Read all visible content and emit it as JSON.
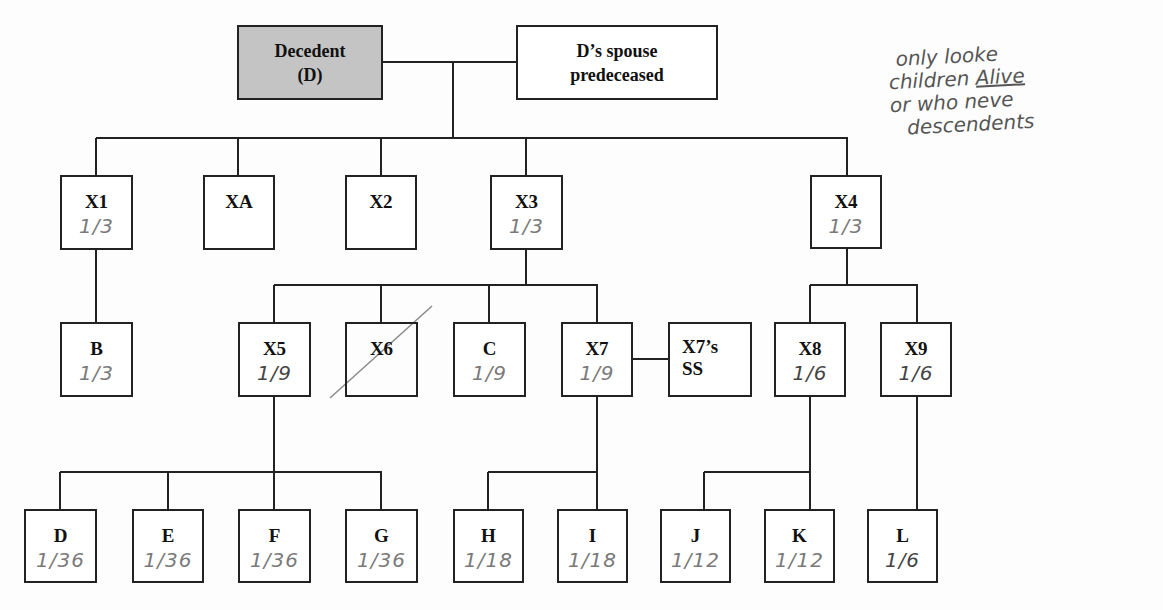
{
  "diagram": {
    "type": "family-tree / intestate succession chart",
    "root": {
      "decedent": {
        "label_line1": "Decedent",
        "label_line2": "(D)",
        "shaded": true
      },
      "spouse": {
        "label_line1": "D’s spouse",
        "label_line2": "predeceased"
      }
    },
    "children": [
      {
        "id": "X1",
        "share": "1/3"
      },
      {
        "id": "XA",
        "share": ""
      },
      {
        "id": "X2",
        "share": ""
      },
      {
        "id": "X3",
        "share": "1/3"
      },
      {
        "id": "X4",
        "share": "1/3"
      }
    ],
    "grandchildren": [
      {
        "id": "B",
        "parent": "X1",
        "share": "1/3"
      },
      {
        "id": "X5",
        "parent": "X3",
        "share": "1/9"
      },
      {
        "id": "X6",
        "parent": "X3",
        "share": "",
        "crossed_out": true
      },
      {
        "id": "C",
        "parent": "X3",
        "share": "1/9"
      },
      {
        "id": "X7",
        "parent": "X3",
        "share": "1/9"
      },
      {
        "id": "X7’s SS",
        "label_line1": "X7’s",
        "label_line2": "SS",
        "spouse_of": "X7"
      },
      {
        "id": "X8",
        "parent": "X4",
        "share": "1/6"
      },
      {
        "id": "X9",
        "parent": "X4",
        "share": "1/6"
      }
    ],
    "great_grandchildren": [
      {
        "id": "D",
        "parent": "X5",
        "share": "1/36"
      },
      {
        "id": "E",
        "parent": "X5",
        "share": "1/36"
      },
      {
        "id": "F",
        "parent": "X5",
        "share": "1/36"
      },
      {
        "id": "G",
        "parent": "X5",
        "share": "1/36"
      },
      {
        "id": "H",
        "parent": "X7",
        "share": "1/18"
      },
      {
        "id": "I",
        "parent": "X7",
        "share": "1/18"
      },
      {
        "id": "J",
        "parent": "X8",
        "share": "1/12"
      },
      {
        "id": "K",
        "parent": "X8",
        "share": "1/12"
      },
      {
        "id": "L",
        "parent": "X9",
        "share": "1/6"
      }
    ]
  },
  "handwritten_note": {
    "line1": "only looke",
    "line2_a": "children ",
    "line2_b": "Alive",
    "line3": "or who neve",
    "line4": "descendents"
  },
  "colors": {
    "decedent_fill": "#c4c4c4",
    "box_border": "#222222",
    "handwriting": "#777777"
  }
}
